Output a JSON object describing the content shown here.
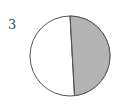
{
  "figure": {
    "label": "3",
    "shaded_fraction_approx": 0.48,
    "colors": {
      "shaded": "#b3b3b3",
      "unshaded": "#ffffff",
      "stroke": "#555555"
    }
  }
}
